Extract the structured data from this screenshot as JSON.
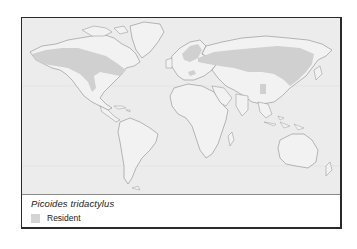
{
  "map": {
    "title": "Picoides tridactylus",
    "colors": {
      "ocean": "#ececec",
      "land": "#f2f2f2",
      "coast": "#8c8c8c",
      "range": "#d0d0d0",
      "frame": "#2a2a2a"
    },
    "regions_shaded": [
      "North America boreal",
      "Northern Eurasia boreal",
      "Central European mountains",
      "Central Asian mountains"
    ]
  },
  "legend": {
    "species_name": "Picoides tridactylus",
    "items": [
      {
        "label": "Resident",
        "color": "#d4d4d4"
      }
    ]
  }
}
